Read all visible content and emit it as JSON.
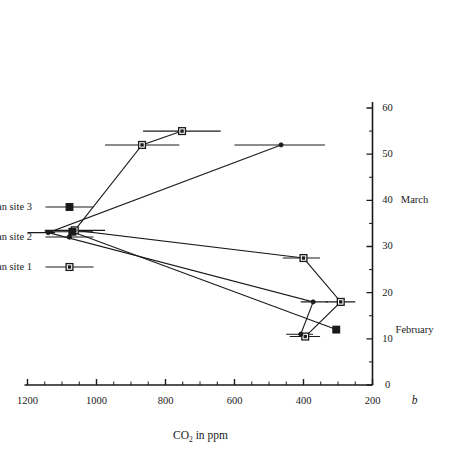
{
  "panel": {
    "label": "b"
  },
  "axes": {
    "y": {
      "title_main": "CO",
      "title_sub": "2",
      "title_tail": " in ppm",
      "title_full": "CO2 in ppm",
      "ticks": [
        "1200",
        "1000",
        "800",
        "600",
        "400",
        "200"
      ],
      "tick_values": [
        1200,
        1000,
        800,
        600,
        400,
        200
      ],
      "min": 200,
      "max": 1200
    },
    "x": {
      "title": "",
      "ticks": [
        "0",
        "10",
        "20",
        "30",
        "40",
        "50",
        "60"
      ],
      "tick_values": [
        0,
        10,
        20,
        30,
        40,
        50,
        60
      ],
      "min": 0,
      "max": 60,
      "month_labels": [
        {
          "text": "February",
          "day": 12
        },
        {
          "text": "March",
          "day": 40
        }
      ]
    }
  },
  "legend": {
    "position": "top-right",
    "items": [
      {
        "label": "Mean site 1",
        "marker": "open-square",
        "color": "#1a1a1a"
      },
      {
        "label": "Mean site 2",
        "marker": "small-dot",
        "color": "#1a1a1a"
      },
      {
        "label": "Mean site 3",
        "marker": "filled-square",
        "color": "#1a1a1a"
      }
    ]
  },
  "chart_data": {
    "type": "line",
    "title": "",
    "subtitle": "",
    "xlabel": "",
    "ylabel": "CO2 in ppm",
    "xlim": [
      0,
      60
    ],
    "ylim": [
      200,
      1200
    ],
    "grid": false,
    "legend_position": "top-right",
    "error_bars": true,
    "panel_label": "b",
    "month_bands": [
      "February",
      "March"
    ],
    "series": [
      {
        "name": "Mean site 1",
        "marker": "open-square",
        "x": [
          10.5,
          18,
          27.5,
          33.5,
          52,
          55
        ],
        "values": [
          395,
          292,
          400,
          1063,
          868,
          752
        ],
        "err_low": [
          352,
          250,
          352,
          975,
          760,
          640
        ],
        "err_high": [
          440,
          335,
          460,
          1150,
          975,
          865
        ]
      },
      {
        "name": "Mean site 2",
        "marker": "small-dot",
        "x": [
          11,
          18,
          33,
          52
        ],
        "values": [
          408,
          372,
          1140,
          465
        ],
        "err_low": [
          372,
          330,
          1200,
          338
        ],
        "err_high": [
          450,
          408,
          1120,
          600
        ]
      },
      {
        "name": "Mean site 3",
        "marker": "filled-square",
        "x": [
          12,
          33.2
        ],
        "values": [
          305,
          1070
        ],
        "err_low": [
          305,
          1150
        ],
        "err_high": [
          305,
          1010
        ]
      }
    ]
  }
}
